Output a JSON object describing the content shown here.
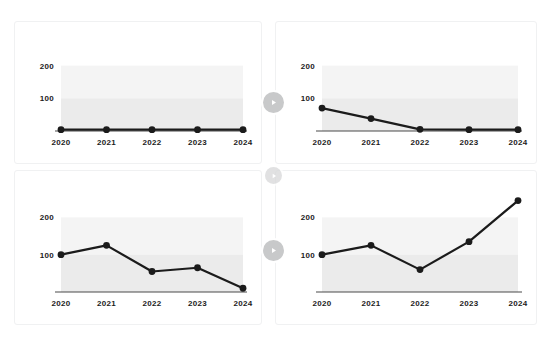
{
  "page": {
    "background_color": "#ffffff",
    "clipped_header_fragments": [
      "",
      "",
      ""
    ]
  },
  "controls": {
    "play_buttons": [
      {
        "name": "play-toggle-row-1",
        "label": "Play",
        "icon": "play-icon",
        "color": "#c8c9ca"
      },
      {
        "name": "play-toggle-row-2",
        "label": "Play",
        "icon": "play-icon",
        "color": "#d7d8d9"
      },
      {
        "name": "play-toggle-row-3",
        "label": "Play",
        "icon": "play-icon",
        "color": "#c8c9ca"
      }
    ]
  },
  "chart_data": [
    {
      "id": "chart-top-left",
      "type": "line",
      "title": "",
      "xlabel": "",
      "ylabel": "",
      "categories": [
        "2020",
        "2021",
        "2022",
        "2023",
        "2024"
      ],
      "values": [
        4,
        4,
        4,
        4,
        4
      ],
      "ytick_labels": [
        "100",
        "200"
      ],
      "ytick_values": [
        100,
        200
      ],
      "ylim": [
        0,
        260
      ],
      "grid": false,
      "legend": "none",
      "series_color": "#1b1b1b"
    },
    {
      "id": "chart-top-right",
      "type": "line",
      "title": "",
      "xlabel": "",
      "ylabel": "",
      "categories": [
        "2020",
        "2021",
        "2022",
        "2023",
        "2024"
      ],
      "values": [
        70,
        38,
        5,
        4,
        4
      ],
      "ytick_labels": [
        "100",
        "200"
      ],
      "ytick_values": [
        100,
        200
      ],
      "ylim": [
        0,
        260
      ],
      "grid": false,
      "legend": "none",
      "series_color": "#1b1b1b"
    },
    {
      "id": "chart-bottom-left",
      "type": "line",
      "title": "",
      "xlabel": "",
      "ylabel": "",
      "categories": [
        "2020",
        "2021",
        "2022",
        "2023",
        "2024"
      ],
      "values": [
        100,
        125,
        55,
        65,
        10
      ],
      "ytick_labels": [
        "100",
        "200"
      ],
      "ytick_values": [
        100,
        200
      ],
      "ylim": [
        0,
        260
      ],
      "grid": false,
      "legend": "none",
      "series_color": "#1b1b1b"
    },
    {
      "id": "chart-bottom-right",
      "type": "line",
      "title": "",
      "xlabel": "",
      "ylabel": "",
      "categories": [
        "2020",
        "2021",
        "2022",
        "2023",
        "2024"
      ],
      "values": [
        100,
        125,
        60,
        135,
        245
      ],
      "ytick_labels": [
        "100",
        "200"
      ],
      "ytick_values": [
        100,
        200
      ],
      "ylim": [
        0,
        260
      ],
      "grid": false,
      "legend": "none",
      "series_color": "#1b1b1b"
    }
  ]
}
